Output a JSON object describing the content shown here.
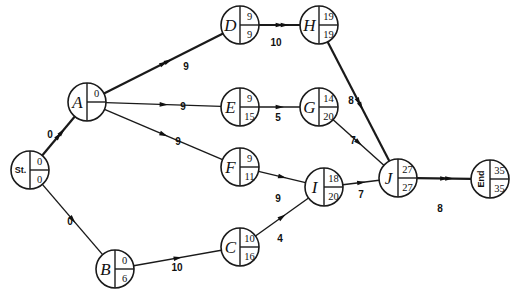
{
  "diagram": {
    "type": "activity-network",
    "nodes": [
      {
        "id": "St",
        "label": "St.",
        "es": "0",
        "ls": "0",
        "x": 30,
        "y": 170,
        "small": true
      },
      {
        "id": "A",
        "label": "A",
        "es": "0",
        "ls": "",
        "x": 87,
        "y": 102
      },
      {
        "id": "B",
        "label": "B",
        "es": "0",
        "ls": "6",
        "x": 115,
        "y": 269
      },
      {
        "id": "C",
        "label": "C",
        "es": "10",
        "ls": "16",
        "x": 240,
        "y": 247
      },
      {
        "id": "D",
        "label": "D",
        "es": "9",
        "ls": "9",
        "x": 240,
        "y": 25
      },
      {
        "id": "E",
        "label": "E",
        "es": "9",
        "ls": "15",
        "x": 240,
        "y": 107
      },
      {
        "id": "F",
        "label": "F",
        "es": "9",
        "ls": "11",
        "x": 240,
        "y": 167
      },
      {
        "id": "G",
        "label": "G",
        "es": "14",
        "ls": "20",
        "x": 319,
        "y": 107
      },
      {
        "id": "H",
        "label": "H",
        "es": "19",
        "ls": "19",
        "x": 319,
        "y": 25
      },
      {
        "id": "I",
        "label": "I",
        "es": "18",
        "ls": "20",
        "x": 324,
        "y": 187
      },
      {
        "id": "J",
        "label": "J",
        "es": "27",
        "ls": "27",
        "x": 398,
        "y": 178
      },
      {
        "id": "End",
        "label": "End",
        "es": "35",
        "ls": "35",
        "x": 490,
        "y": 179,
        "small": true,
        "rotated": true
      }
    ],
    "edges": [
      {
        "from": "St",
        "to": "A",
        "weight": "0",
        "critical": true,
        "lx": 50,
        "ly": 138
      },
      {
        "from": "St",
        "to": "B",
        "weight": "0",
        "critical": false,
        "lx": 70,
        "ly": 225
      },
      {
        "from": "A",
        "to": "D",
        "weight": "9",
        "critical": true,
        "lx": 186,
        "ly": 70
      },
      {
        "from": "A",
        "to": "E",
        "weight": "9",
        "critical": false,
        "lx": 183,
        "ly": 110
      },
      {
        "from": "A",
        "to": "F",
        "weight": "9",
        "critical": false,
        "lx": 178,
        "ly": 145
      },
      {
        "from": "B",
        "to": "C",
        "weight": "10",
        "critical": false,
        "lx": 177,
        "ly": 271
      },
      {
        "from": "D",
        "to": "H",
        "weight": "10",
        "critical": true,
        "lx": 276,
        "ly": 46
      },
      {
        "from": "E",
        "to": "G",
        "weight": "5",
        "critical": false,
        "lx": 278,
        "ly": 121
      },
      {
        "from": "F",
        "to": "I",
        "weight": "9",
        "critical": false,
        "lx": 278,
        "ly": 202
      },
      {
        "from": "C",
        "to": "I",
        "weight": "4",
        "critical": false,
        "lx": 280,
        "ly": 242
      },
      {
        "from": "G",
        "to": "J",
        "weight": "7",
        "critical": false,
        "lx": 353,
        "ly": 144
      },
      {
        "from": "H",
        "to": "J",
        "weight": "8",
        "critical": true,
        "lx": 351,
        "ly": 104
      },
      {
        "from": "I",
        "to": "J",
        "weight": "7",
        "critical": false,
        "lx": 361,
        "ly": 198
      },
      {
        "from": "J",
        "to": "End",
        "weight": "8",
        "critical": true,
        "lx": 440,
        "ly": 212
      }
    ],
    "node_radius": 19
  }
}
